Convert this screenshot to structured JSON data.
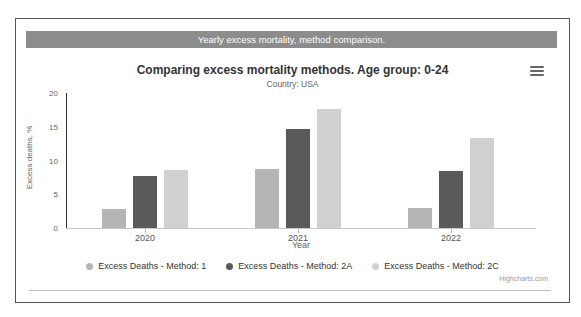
{
  "header_bar": {
    "text": "Yearly excess mortality, method comparison.",
    "background": "#8c8c8c",
    "text_color": "#ffffff"
  },
  "chart": {
    "title": "Comparing excess mortality methods. Age group: 0-24",
    "subtitle": "Country: USA",
    "credits": "Highcharts.com",
    "menu_icon": "hamburger-menu-icon"
  },
  "chart_data": {
    "type": "bar",
    "title": "Comparing excess mortality methods. Age group: 0-24",
    "subtitle": "Country: USA",
    "categories": [
      "2020",
      "2021",
      "2022"
    ],
    "series": [
      {
        "name": "Excess Deaths - Method: 1",
        "color": "#b5b5b5",
        "values": [
          2.8,
          8.8,
          2.9
        ]
      },
      {
        "name": "Excess Deaths - Method: 2A",
        "color": "#5a5a5a",
        "values": [
          7.7,
          14.6,
          8.4
        ]
      },
      {
        "name": "Excess Deaths - Method: 2C",
        "color": "#d0d0d0",
        "values": [
          8.6,
          17.7,
          13.4
        ]
      }
    ],
    "xlabel": "Year",
    "ylabel": "Excess deaths, %",
    "ylim": [
      0,
      20
    ],
    "yticks": [
      0,
      5,
      10,
      15,
      20
    ],
    "grid": false,
    "legend_position": "bottom"
  }
}
